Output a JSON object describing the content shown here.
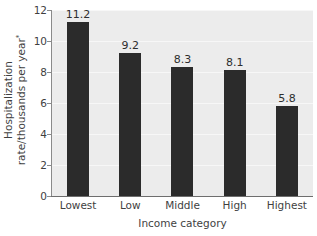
{
  "chart_data": {
    "type": "bar",
    "title": "",
    "subtitle": "",
    "categories": [
      "Lowest",
      "Low",
      "Middle",
      "High",
      "Highest"
    ],
    "values": [
      11.2,
      9.2,
      8.3,
      8.1,
      5.8
    ],
    "value_labels": [
      "11.2",
      "9.2",
      "8.3",
      "8.1",
      "5.8"
    ],
    "xlabel": "Income category",
    "ylabel_line1": "Hospitalization",
    "ylabel_line2": "rate/thousands per year",
    "ylabel_footnote_marker": "*",
    "ylim": [
      0,
      12
    ],
    "yticks": [
      0,
      2,
      4,
      6,
      8,
      10,
      12
    ],
    "ytick_labels": [
      "0",
      "2",
      "4",
      "6",
      "8",
      "10",
      "12"
    ],
    "grid": true,
    "grid_axis": "y",
    "legend": null,
    "legend_position": "none",
    "colors": {
      "bar": "#2b2b2b",
      "plot_background": "#ececec",
      "figure_background": "#ffffff",
      "gridline": "#f7f7f7",
      "axis_line": "#6e6e6e",
      "text": "#3f3f3f"
    }
  }
}
